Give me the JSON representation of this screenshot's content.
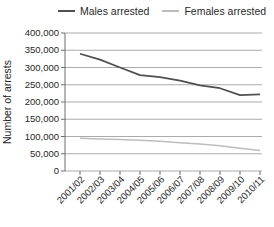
{
  "chart_data": {
    "type": "line",
    "title": "",
    "xlabel": "",
    "ylabel": "Number of arrests",
    "categories": [
      "2001/02",
      "2002/03",
      "2003/04",
      "2004/05",
      "2005/06",
      "2006/07",
      "2007/08",
      "2008/09",
      "2009/10",
      "2010/11"
    ],
    "series": [
      {
        "name": "Males arrested",
        "color": "#4f4f4f",
        "stroke_width": 1.7,
        "values": [
          340000,
          323000,
          300000,
          278000,
          272000,
          262000,
          248000,
          240000,
          220000,
          222000
        ]
      },
      {
        "name": "Females arrested",
        "color": "#bdbdbd",
        "stroke_width": 1.5,
        "values": [
          95000,
          93000,
          91000,
          89000,
          86000,
          82000,
          78000,
          73000,
          66000,
          59000
        ]
      }
    ],
    "ylim": [
      0,
      400000
    ],
    "ytick_step": 50000,
    "ytick_labels": [
      "0",
      "50,000",
      "100,000",
      "150,000",
      "200,000",
      "250,000",
      "300,000",
      "350,000",
      "400,000"
    ],
    "grid": "horizontal",
    "legend_position": "top",
    "x_label_rotation": -45
  },
  "legend": {
    "items": [
      {
        "label": "Males arrested",
        "color": "#4f4f4f"
      },
      {
        "label": "Females arrested",
        "color": "#bdbdbd"
      }
    ]
  },
  "colors": {
    "background": "#ffffff",
    "gridline": "#8f8f8f",
    "axis": "#6e6e6e",
    "text": "#1f1f1f"
  }
}
